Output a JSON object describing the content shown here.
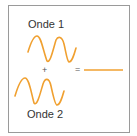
{
  "diagram": {
    "wave1_label": "Onde 1",
    "wave2_label": "Onde 2",
    "plus_sign": "+",
    "equals_sign": "=",
    "wave_color": "#f0a030",
    "result_color": "#f0a030",
    "border_color": "#9a9a9a"
  }
}
